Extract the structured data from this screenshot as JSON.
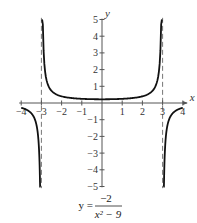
{
  "chart_data": {
    "type": "line",
    "title": "",
    "caption": {
      "lhs": "y =",
      "numerator": "−2",
      "denominator": "x² − 9"
    },
    "xlabel": "x",
    "ylabel": "y",
    "xlim": [
      -4,
      4
    ],
    "ylim": [
      -5,
      5
    ],
    "x_ticks": [
      -4,
      -3,
      -2,
      -1,
      1,
      2,
      3,
      4
    ],
    "x_tick_labels": [
      "−4",
      "−3",
      "−2",
      "−1",
      "1",
      "2",
      "3",
      "4"
    ],
    "y_ticks": [
      -5,
      -4,
      -3,
      -2,
      -1,
      1,
      2,
      3,
      4,
      5
    ],
    "y_tick_labels": [
      "−5",
      "−4",
      "−3",
      "−2",
      "−1",
      "1",
      "2",
      "3",
      "4",
      "5"
    ],
    "grid": false,
    "asymptotes": [
      {
        "type": "vertical",
        "x": -3,
        "style": "dashed"
      },
      {
        "type": "vertical",
        "x": 3,
        "style": "dashed"
      }
    ],
    "function": "y = -2/(x^2 - 9)",
    "series": [
      {
        "name": "left branch",
        "x": [
          -4,
          -3.8,
          -3.6,
          -3.4,
          -3.2,
          -3.1
        ],
        "y": [
          -0.29,
          -0.37,
          -0.51,
          -0.78,
          -1.61,
          -3.28
        ]
      },
      {
        "name": "middle branch",
        "x": [
          -2.9,
          -2.5,
          -2,
          -1,
          0,
          1,
          2,
          2.5,
          2.9
        ],
        "y": [
          3.39,
          0.73,
          0.4,
          0.25,
          0.22,
          0.25,
          0.4,
          0.73,
          3.39
        ]
      },
      {
        "name": "right branch",
        "x": [
          3.1,
          3.2,
          3.4,
          3.6,
          3.8,
          4
        ],
        "y": [
          -3.28,
          -1.61,
          -0.78,
          -0.51,
          -0.37,
          -0.29
        ]
      }
    ],
    "colors": {
      "curve": "#111111",
      "axis": "#555555",
      "asymptote": "#777777"
    }
  }
}
